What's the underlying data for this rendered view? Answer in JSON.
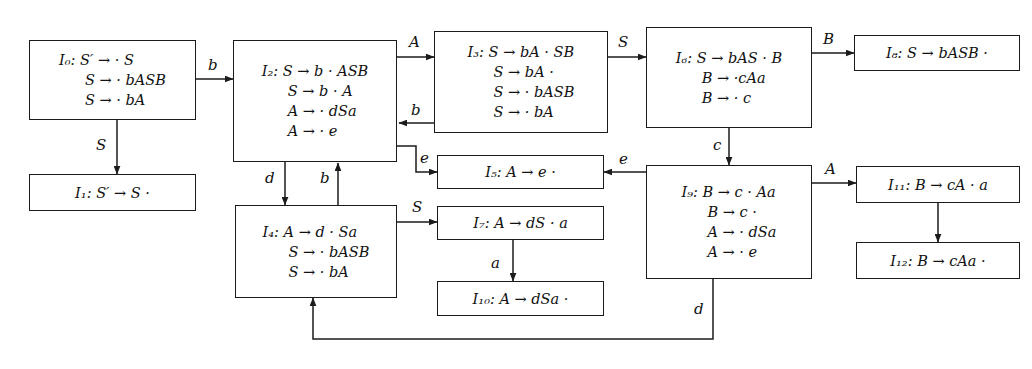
{
  "diagram": {
    "background_color": "#ffffff",
    "line_color": "#1b1b1b",
    "text_color": "#111111"
  },
  "nodes": [
    {
      "id": "I0",
      "name": "state-I0",
      "label": "I",
      "index": "0",
      "lines": [
        "I₀: S′ → · S",
        "S → · bASB",
        "S → · bA"
      ],
      "items": [
        "S′ → · S",
        "S → · bASB",
        "S → · bA"
      ]
    },
    {
      "id": "I1",
      "name": "state-I1",
      "label": "I",
      "index": "1",
      "lines": [
        "I₁: S′ → S ·"
      ],
      "items": [
        "S′ → S ·"
      ]
    },
    {
      "id": "I2",
      "name": "state-I2",
      "label": "I",
      "index": "2",
      "lines": [
        "I₂: S → b · ASB",
        "S → b · A",
        "A → · dSa",
        "A → · e"
      ],
      "items": [
        "S → b · ASB",
        "S → b · A",
        "A → · dSa",
        "A → · e"
      ]
    },
    {
      "id": "I3",
      "name": "state-I3",
      "label": "I",
      "index": "3",
      "lines": [
        "I₃: S → bA · SB",
        "S → bA ·",
        "S → · bASB",
        "S → · bA"
      ],
      "items": [
        "S → bA · SB",
        "S → bA ·",
        "S → · bASB",
        "S → · bA"
      ]
    },
    {
      "id": "I4",
      "name": "state-I4",
      "label": "I",
      "index": "4",
      "lines": [
        "I₄: A → d · Sa",
        "S → · bASB",
        "S → · bA"
      ],
      "items": [
        "A → d · Sa",
        "S → · bASB",
        "S → · bA"
      ]
    },
    {
      "id": "I5",
      "name": "state-I5",
      "label": "I",
      "index": "5",
      "lines": [
        "I₅: A → e ·"
      ],
      "items": [
        "A → e ·"
      ]
    },
    {
      "id": "I6",
      "name": "state-I6",
      "label": "I",
      "index": "6",
      "lines": [
        "I₆: S → bAS · B",
        "B → ·cAa",
        "B → · c"
      ],
      "items": [
        "S → bAS · B",
        "B → ·cAa",
        "B → · c"
      ]
    },
    {
      "id": "I7",
      "name": "state-I7",
      "label": "I",
      "index": "7",
      "lines": [
        "I₇: A → dS · a"
      ],
      "items": [
        "A → dS · a"
      ]
    },
    {
      "id": "I8",
      "name": "state-I8",
      "label": "I",
      "index": "8",
      "lines": [
        "I₈: S → bASB ·"
      ],
      "items": [
        "S → bASB ·"
      ]
    },
    {
      "id": "I9",
      "name": "state-I9",
      "label": "I",
      "index": "9",
      "lines": [
        "I₉: B → c · Aa",
        "B → c ·",
        "A → · dSa",
        "A → · e"
      ],
      "items": [
        "B → c · Aa",
        "B → c ·",
        "A → · dSa",
        "A → · e"
      ]
    },
    {
      "id": "I10",
      "name": "state-I10",
      "label": "I",
      "index": "10",
      "lines": [
        "I₁₀: A → dSa ·"
      ],
      "items": [
        "A → dSa ·"
      ]
    },
    {
      "id": "I11",
      "name": "state-I11",
      "label": "I",
      "index": "11",
      "lines": [
        "I₁₁: B → cA · a"
      ],
      "items": [
        "B → cA · a"
      ]
    },
    {
      "id": "I12",
      "name": "state-I12",
      "label": "I",
      "index": "12",
      "lines": [
        "I₁₂: B → cAa ·"
      ],
      "items": [
        "B → cAa ·"
      ]
    }
  ],
  "edges": [
    {
      "from": "I0",
      "to": "I1",
      "label": "S",
      "name": "edge-I0-I1-S"
    },
    {
      "from": "I0",
      "to": "I2",
      "label": "b",
      "name": "edge-I0-I2-b"
    },
    {
      "from": "I2",
      "to": "I3",
      "label": "A",
      "name": "edge-I2-I3-A"
    },
    {
      "from": "I3",
      "to": "I2",
      "label": "b",
      "name": "edge-I3-I2-b"
    },
    {
      "from": "I2",
      "to": "I5",
      "label": "e",
      "name": "edge-I2-I5-e"
    },
    {
      "from": "I2",
      "to": "I4",
      "label": "d",
      "name": "edge-I2-I4-d"
    },
    {
      "from": "I4",
      "to": "I2",
      "label": "b",
      "name": "edge-I4-I2-b"
    },
    {
      "from": "I3",
      "to": "I6",
      "label": "S",
      "name": "edge-I3-I6-S"
    },
    {
      "from": "I6",
      "to": "I8",
      "label": "B",
      "name": "edge-I6-I8-B"
    },
    {
      "from": "I6",
      "to": "I9",
      "label": "c",
      "name": "edge-I6-I9-c"
    },
    {
      "from": "I9",
      "to": "I5",
      "label": "e",
      "name": "edge-I9-I5-e"
    },
    {
      "from": "I9",
      "to": "I11",
      "label": "A",
      "name": "edge-I9-I11-A"
    },
    {
      "from": "I11",
      "to": "I12",
      "label": "a",
      "name": "edge-I11-I12-a"
    },
    {
      "from": "I4",
      "to": "I7",
      "label": "S",
      "name": "edge-I4-I7-S"
    },
    {
      "from": "I7",
      "to": "I10",
      "label": "a",
      "name": "edge-I7-I10-a"
    },
    {
      "from": "I9",
      "to": "I4",
      "label": "d",
      "name": "edge-I9-I4-d"
    }
  ],
  "edge_labels": {
    "I0_I1": "S",
    "I0_I2": "b",
    "I2_I3": "A",
    "I3_I2": "b",
    "I2_I5": "e",
    "I2_I4": "d",
    "I4_I2": "b",
    "I3_I6": "S",
    "I6_I8": "B",
    "I6_I9": "c",
    "I9_I5": "e",
    "I9_I11": "A",
    "I11_I12": "a",
    "I4_I7": "S",
    "I7_I10": "a",
    "I9_I4": "d"
  }
}
